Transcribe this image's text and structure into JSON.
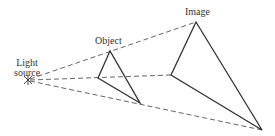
{
  "diagram": {
    "labels": {
      "light_source": [
        "Light",
        "source"
      ],
      "object": "Object",
      "image": "Image"
    },
    "colors": {
      "line": "#333333",
      "dash": "#555555"
    }
  }
}
